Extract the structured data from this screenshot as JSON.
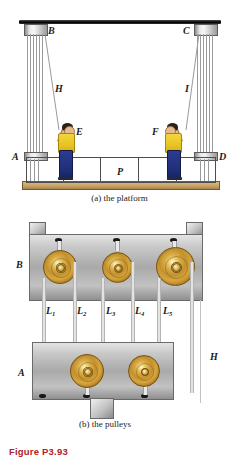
{
  "figure": {
    "title": "Figure P3.93",
    "title_color": "#b32222"
  },
  "part_a": {
    "caption": "(a) the platform",
    "labels": {
      "top_left_block": "B",
      "top_right_block": "C",
      "left_rope": "H",
      "right_rope": "I",
      "left_side_block": "A",
      "right_side_block": "D",
      "left_worker": "E",
      "right_worker": "F",
      "platform": "P"
    }
  },
  "part_b": {
    "caption": "(b) the pulleys",
    "labels": {
      "upper_block": "B",
      "lower_block": "A",
      "hanging_rope": "H",
      "segments": [
        {
          "text": "L",
          "sub": "1"
        },
        {
          "text": "L",
          "sub": "2"
        },
        {
          "text": "L",
          "sub": "3"
        },
        {
          "text": "L",
          "sub": "4"
        },
        {
          "text": "L",
          "sub": "5"
        }
      ]
    }
  },
  "colors": {
    "pulley_gold": "#c2912f",
    "block_steel": "#a9a9a9",
    "beam_black": "#111111",
    "deck_wood": "#c9a367",
    "worker_shirt": "#e8c424",
    "worker_pants": "#1f2e77",
    "rope_gray": "#9a9a9a"
  }
}
